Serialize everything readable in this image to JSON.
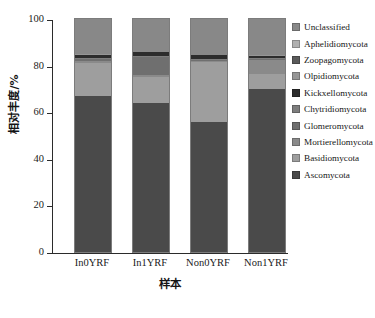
{
  "chart_data": {
    "type": "bar",
    "stacked": true,
    "title": "",
    "xlabel": "样本",
    "ylabel": "相对丰度/%",
    "categories": [
      "In0YRF",
      "In1YRF",
      "Non0YRF",
      "Non1YRF"
    ],
    "ylim": [
      0,
      100
    ],
    "yticks": [
      0,
      20,
      40,
      60,
      80,
      100
    ],
    "ytick_labels": [
      "0",
      "20",
      "40",
      "60",
      "80",
      "100"
    ],
    "grid": false,
    "legend_position": "right",
    "series": [
      {
        "name": "Ascomycota",
        "color": "#4a4a4a",
        "values": [
          67.0,
          64.0,
          56.0,
          70.0
        ]
      },
      {
        "name": "Basidiomycota",
        "color": "#9e9e9e",
        "values": [
          14.0,
          11.0,
          25.5,
          6.5
        ]
      },
      {
        "name": "Mortierellomycota",
        "color": "#8a8a8a",
        "values": [
          1.2,
          1.0,
          0.6,
          6.0
        ]
      },
      {
        "name": "Glomeromycota",
        "color": "#6f6f6f",
        "values": [
          0.5,
          7.8,
          0.5,
          0.4
        ]
      },
      {
        "name": "Chytridiomycota",
        "color": "#7d7d7d",
        "values": [
          0.5,
          0.4,
          0.4,
          0.4
        ]
      },
      {
        "name": "Kickxellomycota",
        "color": "#2c2c2c",
        "values": [
          1.4,
          1.5,
          1.5,
          1.0
        ]
      },
      {
        "name": "Olpidiomycota",
        "color": "#969696",
        "values": [
          0.2,
          0.1,
          0.1,
          0.1
        ]
      },
      {
        "name": "Zoopagomycota",
        "color": "#5a5a5a",
        "values": [
          0.2,
          0.1,
          0.1,
          0.1
        ]
      },
      {
        "name": "Aphelidiomycota",
        "color": "#b0b0b0",
        "values": [
          0.2,
          0.1,
          0.1,
          0.1
        ]
      },
      {
        "name": "Unclassified",
        "color": "#888888",
        "values": [
          14.8,
          14.0,
          15.2,
          15.4
        ]
      }
    ]
  },
  "axes": {
    "ylabel": "相对丰度/%",
    "xlabel": "样本",
    "ytick_labels": [
      "100",
      "80",
      "60",
      "40",
      "20",
      "0"
    ],
    "xtick_labels": [
      "In0YRF",
      "In1YRF",
      "Non0YRF",
      "Non1YRF"
    ]
  },
  "legend": {
    "items": [
      {
        "label": "Unclassified",
        "color": "#888888"
      },
      {
        "label": "Aphelidiomycota",
        "color": "#b0b0b0"
      },
      {
        "label": "Zoopagomycota",
        "color": "#5a5a5a"
      },
      {
        "label": "Olpidiomycota",
        "color": "#969696"
      },
      {
        "label": "Kickxellomycota",
        "color": "#2c2c2c"
      },
      {
        "label": "Chytridiomycota",
        "color": "#7d7d7d"
      },
      {
        "label": "Glomeromycota",
        "color": "#6f6f6f"
      },
      {
        "label": "Mortierellomycota",
        "color": "#8a8a8a"
      },
      {
        "label": "Basidiomycota",
        "color": "#9e9e9e"
      },
      {
        "label": "Ascomycota",
        "color": "#4a4a4a"
      }
    ]
  }
}
